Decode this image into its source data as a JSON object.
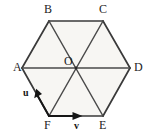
{
  "figure": {
    "name": "regular-hexagon-with-vectors",
    "background_color": "#ffffff",
    "fill_color": "#f7f6f3",
    "stroke_color": "#3a3a3a",
    "label_color": "#1c1c1c"
  },
  "vertices": {
    "A": {
      "label": "A",
      "x": 22,
      "y": 68,
      "label_x": 13,
      "label_y": 62
    },
    "B": {
      "label": "B",
      "x": 49,
      "y": 21,
      "label_x": 44,
      "label_y": 4
    },
    "C": {
      "label": "C",
      "x": 103,
      "y": 21,
      "label_x": 99,
      "label_y": 4
    },
    "D": {
      "label": "D",
      "x": 130,
      "y": 68,
      "label_x": 134,
      "label_y": 62
    },
    "E": {
      "label": "E",
      "x": 103,
      "y": 116,
      "label_x": 99,
      "label_y": 120
    },
    "F": {
      "label": "F",
      "x": 49,
      "y": 116,
      "label_x": 44,
      "label_y": 120
    },
    "O": {
      "label": "O",
      "x": 76,
      "y": 68,
      "label_x": 64,
      "label_y": 56
    }
  },
  "edges": [
    {
      "name": "edge-AB",
      "from": "A",
      "to": "B"
    },
    {
      "name": "edge-BC",
      "from": "B",
      "to": "C"
    },
    {
      "name": "edge-CD",
      "from": "C",
      "to": "D"
    },
    {
      "name": "edge-DE",
      "from": "D",
      "to": "E"
    },
    {
      "name": "edge-EF",
      "from": "E",
      "to": "F"
    },
    {
      "name": "edge-FA",
      "from": "F",
      "to": "A"
    }
  ],
  "diagonals": [
    {
      "name": "diagonal-AD",
      "from": "A",
      "to": "D"
    },
    {
      "name": "diagonal-BE",
      "from": "B",
      "to": "E"
    },
    {
      "name": "diagonal-CF",
      "from": "C",
      "to": "F"
    }
  ],
  "vectors": [
    {
      "name": "vector-u",
      "label": "u",
      "along_edge": "FA",
      "from": "F",
      "to": "A",
      "arrow_tip_x": 38,
      "arrow_tip_y": 89,
      "label_x": 24,
      "label_y": 91
    },
    {
      "name": "vector-v",
      "label": "v",
      "along_edge": "FE",
      "from": "F",
      "to": "E",
      "arrow_tip_x": 81,
      "arrow_tip_y": 116,
      "label_x": 74,
      "label_y": 122
    }
  ]
}
